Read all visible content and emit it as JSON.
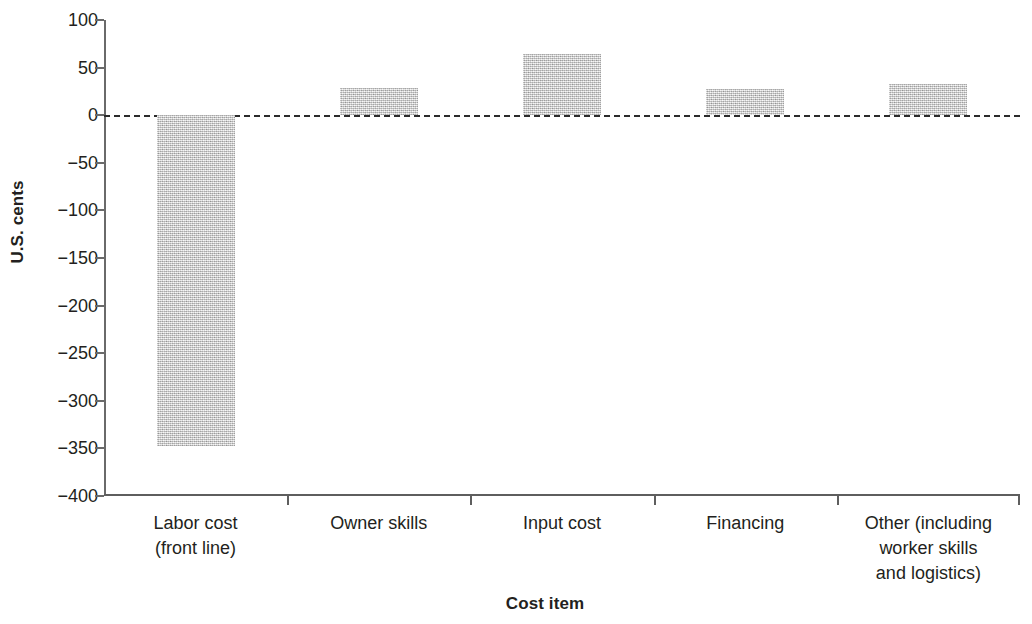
{
  "chart_data": {
    "type": "bar",
    "title": "",
    "xlabel": "Cost item",
    "ylabel": "U.S. cents",
    "ylim": [
      -400,
      100
    ],
    "yticks": [
      100,
      50,
      0,
      -50,
      -100,
      -150,
      -200,
      -250,
      -300,
      -350,
      -400
    ],
    "ytick_labels": [
      "100",
      "50",
      "0",
      "−50",
      "−100",
      "−150",
      "−200",
      "−250",
      "−300",
      "−350",
      "−400"
    ],
    "grid": false,
    "legend": "none",
    "zero_line": {
      "value": 0,
      "style": "dashed",
      "color": "#2b2b2b"
    },
    "bar_color": "#c9c9c9",
    "bar_texture": "speckled-gray",
    "categories": [
      "Labor cost\n(front line)",
      "Owner skills",
      "Input cost",
      "Financing",
      "Other (including\nworker skills\nand logistics)"
    ],
    "category_lines": [
      [
        "Labor cost",
        "(front line)"
      ],
      [
        "Owner skills"
      ],
      [
        "Input cost"
      ],
      [
        "Financing"
      ],
      [
        "Other (including",
        "worker skills",
        "and logistics)"
      ]
    ],
    "values": [
      -348,
      29,
      64,
      27,
      33
    ]
  }
}
